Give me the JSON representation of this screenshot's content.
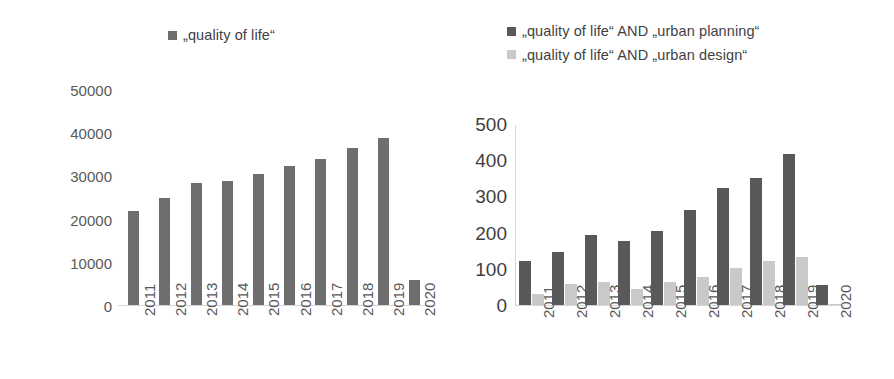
{
  "chart_data": [
    {
      "id": "left",
      "type": "bar",
      "title": "",
      "xlabel": "",
      "ylabel": "",
      "categories": [
        "2011",
        "2012",
        "2013",
        "2014",
        "2015",
        "2016",
        "2017",
        "2018",
        "2019",
        "2020"
      ],
      "values": [
        22000,
        25000,
        28500,
        29000,
        30500,
        32500,
        34000,
        36500,
        39000,
        6000
      ],
      "series": [
        {
          "name": "„quality of life“",
          "color": "#6e6e6e",
          "values": [
            22000,
            25000,
            28500,
            29000,
            30500,
            32500,
            34000,
            36500,
            39000,
            6000
          ]
        }
      ],
      "ylim": [
        0,
        50000
      ],
      "yticks": [
        0,
        10000,
        20000,
        30000,
        40000,
        50000
      ],
      "ytick_labels": [
        "0",
        "10000",
        "20000",
        "30000",
        "40000",
        "50000"
      ],
      "grid": false,
      "legend_position": "top-center"
    },
    {
      "id": "right",
      "type": "bar",
      "title": "",
      "xlabel": "",
      "ylabel": "",
      "categories": [
        "2011",
        "2012",
        "2013",
        "2014",
        "2015",
        "2016",
        "2017",
        "2018",
        "2019",
        "2020"
      ],
      "series": [
        {
          "name": "„quality of life“ AND „urban planning“",
          "color": "#595959",
          "values": [
            125,
            148,
            195,
            180,
            208,
            265,
            325,
            353,
            420,
            57
          ]
        },
        {
          "name": "„quality of life“ AND „urban design“",
          "color": "#c9c9c9",
          "values": [
            33,
            62,
            65,
            48,
            65,
            80,
            105,
            125,
            135,
            5
          ]
        }
      ],
      "ylim": [
        0,
        500
      ],
      "yticks": [
        0,
        100,
        200,
        300,
        400,
        500
      ],
      "ytick_labels": [
        "0",
        "100",
        "200",
        "300",
        "400",
        "500"
      ],
      "grid": false,
      "legend_position": "top-left"
    }
  ]
}
